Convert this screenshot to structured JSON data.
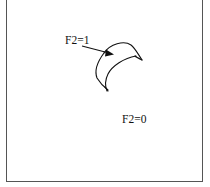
{
  "figure": {
    "labels": {
      "inside_region": "F2=1",
      "outside_region": "F2=0"
    },
    "colors": {
      "stroke": "#111111",
      "border": "#555555",
      "background": "#ffffff"
    }
  }
}
